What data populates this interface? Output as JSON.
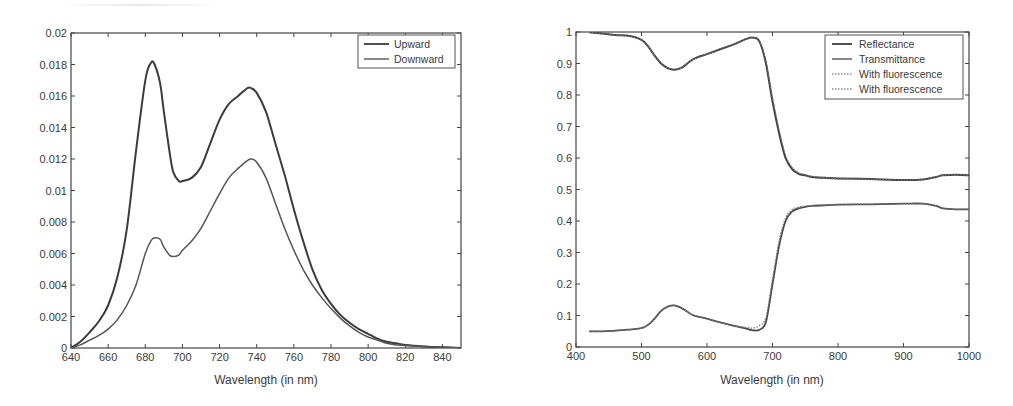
{
  "chart_data": [
    {
      "type": "line",
      "title": "",
      "xlabel": "Wavelength (in nm)",
      "ylabel": "",
      "xlim": [
        640,
        850
      ],
      "ylim": [
        0,
        0.02
      ],
      "xticks": [
        640,
        660,
        680,
        700,
        720,
        740,
        760,
        780,
        800,
        820,
        840
      ],
      "xtick_labels": [
        "640",
        "660",
        "680",
        "700",
        "720",
        "740",
        "760",
        "780",
        "800",
        "820",
        "840"
      ],
      "yticks": [
        0,
        0.002,
        0.004,
        0.006,
        0.008,
        0.01,
        0.012,
        0.014,
        0.016,
        0.018,
        0.02
      ],
      "ytick_labels": [
        "0",
        "0.002",
        "0.004",
        "0.006",
        "0.008",
        "0.01",
        "0.012",
        "0.014",
        "0.016",
        "0.018",
        "0.02"
      ],
      "grid": false,
      "legend_position": "upper right",
      "x": [
        640,
        645,
        650,
        655,
        660,
        665,
        670,
        675,
        680,
        683,
        685,
        688,
        690,
        693,
        695,
        698,
        700,
        705,
        710,
        715,
        720,
        725,
        730,
        735,
        737,
        740,
        745,
        750,
        755,
        760,
        765,
        770,
        775,
        780,
        785,
        790,
        795,
        800,
        805,
        810,
        815,
        820,
        830,
        840,
        850
      ],
      "series": [
        {
          "name": "Upward",
          "values": [
            0.0,
            0.0004,
            0.001,
            0.0017,
            0.0027,
            0.0045,
            0.0075,
            0.0125,
            0.017,
            0.0181,
            0.018,
            0.0168,
            0.015,
            0.0125,
            0.0112,
            0.0106,
            0.0106,
            0.0108,
            0.0115,
            0.013,
            0.0145,
            0.0155,
            0.016,
            0.0165,
            0.0165,
            0.0162,
            0.015,
            0.013,
            0.011,
            0.0088,
            0.0068,
            0.005,
            0.0037,
            0.0028,
            0.0021,
            0.0016,
            0.0012,
            0.0009,
            0.0006,
            0.0004,
            0.0003,
            0.0002,
            0.0001,
            5e-05,
            0.0
          ]
        },
        {
          "name": "Downward",
          "values": [
            0.0,
            0.0002,
            0.0005,
            0.0008,
            0.0012,
            0.0018,
            0.0027,
            0.004,
            0.006,
            0.0068,
            0.007,
            0.0069,
            0.0064,
            0.0059,
            0.0058,
            0.0059,
            0.0062,
            0.0068,
            0.0076,
            0.0087,
            0.0098,
            0.0108,
            0.0114,
            0.0119,
            0.012,
            0.0118,
            0.0108,
            0.0092,
            0.0076,
            0.0062,
            0.005,
            0.004,
            0.0032,
            0.0025,
            0.0019,
            0.0014,
            0.001,
            0.0007,
            0.0005,
            0.0003,
            0.0002,
            0.00015,
            0.0001,
            5e-05,
            0.0
          ]
        }
      ]
    },
    {
      "type": "line",
      "title": "",
      "xlabel": "Wavelength (in nm)",
      "ylabel": "",
      "xlim": [
        400,
        1000
      ],
      "ylim": [
        0,
        1
      ],
      "xticks": [
        400,
        500,
        600,
        700,
        800,
        900,
        1000
      ],
      "xtick_labels": [
        "400",
        "500",
        "600",
        "700",
        "800",
        "900",
        "1000"
      ],
      "yticks": [
        0,
        0.1,
        0.2,
        0.3,
        0.4,
        0.5,
        0.6,
        0.7,
        0.8,
        0.9,
        1
      ],
      "ytick_labels": [
        "0",
        "0.1",
        "0.2",
        "0.3",
        "0.4",
        "0.5",
        "0.6",
        "0.7",
        "0.8",
        "0.9",
        "1"
      ],
      "grid": false,
      "legend_position": "upper right",
      "x": [
        420,
        440,
        460,
        480,
        500,
        510,
        520,
        530,
        540,
        550,
        560,
        570,
        580,
        600,
        620,
        640,
        660,
        670,
        680,
        690,
        700,
        710,
        720,
        730,
        740,
        750,
        760,
        780,
        800,
        850,
        900,
        930,
        950,
        960,
        980,
        1000
      ],
      "series": [
        {
          "name": "Reflectance",
          "style": "solid",
          "values": [
            0.999,
            0.995,
            0.99,
            0.988,
            0.975,
            0.955,
            0.925,
            0.9,
            0.885,
            0.88,
            0.885,
            0.9,
            0.915,
            0.93,
            0.945,
            0.96,
            0.978,
            0.982,
            0.97,
            0.9,
            0.78,
            0.68,
            0.6,
            0.565,
            0.55,
            0.545,
            0.54,
            0.537,
            0.535,
            0.533,
            0.53,
            0.532,
            0.54,
            0.545,
            0.547,
            0.545
          ]
        },
        {
          "name": "Transmittance",
          "style": "solid",
          "values": [
            0.05,
            0.05,
            0.052,
            0.055,
            0.06,
            0.07,
            0.09,
            0.115,
            0.128,
            0.132,
            0.125,
            0.112,
            0.1,
            0.09,
            0.078,
            0.068,
            0.058,
            0.053,
            0.055,
            0.08,
            0.2,
            0.32,
            0.4,
            0.43,
            0.44,
            0.445,
            0.448,
            0.45,
            0.452,
            0.453,
            0.455,
            0.455,
            0.448,
            0.44,
            0.437,
            0.437
          ]
        },
        {
          "name": "With fluorescence",
          "style": "dotted",
          "values": [
            0.999,
            0.995,
            0.99,
            0.988,
            0.975,
            0.955,
            0.925,
            0.9,
            0.885,
            0.88,
            0.885,
            0.9,
            0.915,
            0.93,
            0.945,
            0.96,
            0.978,
            0.982,
            0.972,
            0.905,
            0.79,
            0.69,
            0.608,
            0.57,
            0.553,
            0.547,
            0.542,
            0.538,
            0.535,
            0.533,
            0.53,
            0.532,
            0.54,
            0.545,
            0.547,
            0.545
          ]
        },
        {
          "name": "With fluorescence",
          "style": "dotted",
          "values": [
            0.05,
            0.05,
            0.052,
            0.055,
            0.06,
            0.07,
            0.09,
            0.115,
            0.128,
            0.132,
            0.125,
            0.112,
            0.1,
            0.09,
            0.078,
            0.068,
            0.062,
            0.06,
            0.068,
            0.095,
            0.215,
            0.335,
            0.41,
            0.436,
            0.444,
            0.447,
            0.449,
            0.451,
            0.452,
            0.453,
            0.455,
            0.455,
            0.448,
            0.44,
            0.437,
            0.437
          ]
        }
      ]
    }
  ],
  "left_chart": {
    "xlabel": "Wavelength (in nm)",
    "legend": [
      "Upward",
      "Downward"
    ]
  },
  "right_chart": {
    "xlabel": "Wavelength (in nm)",
    "legend": [
      "Reflectance",
      "Transmittance",
      "With fluorescence",
      "With fluorescence"
    ]
  },
  "colors": {
    "line": "#3c3c3c",
    "line_light": "#555555",
    "axis": "#444444",
    "text": "#3a3a3a",
    "background": "#ffffff"
  }
}
